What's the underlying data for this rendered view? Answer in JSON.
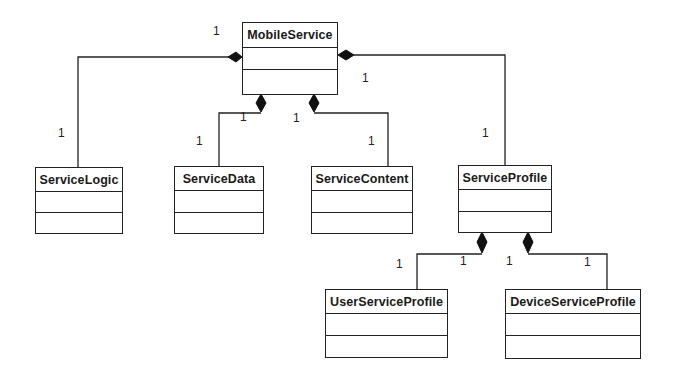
{
  "diagram": {
    "type": "UML class diagram",
    "classes": [
      {
        "id": "mobile_service",
        "name": "MobileService"
      },
      {
        "id": "service_logic",
        "name": "ServiceLogic"
      },
      {
        "id": "service_data",
        "name": "ServiceData"
      },
      {
        "id": "service_content",
        "name": "ServiceContent"
      },
      {
        "id": "service_profile",
        "name": "ServiceProfile"
      },
      {
        "id": "user_service_profile",
        "name": "UserServiceProfile"
      },
      {
        "id": "device_service_profile",
        "name": "DeviceServiceProfile"
      }
    ],
    "relationships": [
      {
        "type": "composition",
        "whole": "MobileService",
        "part": "ServiceLogic",
        "whole_multiplicity": "1",
        "part_multiplicity": "1"
      },
      {
        "type": "composition",
        "whole": "MobileService",
        "part": "ServiceData",
        "whole_multiplicity": "1",
        "part_multiplicity": "1"
      },
      {
        "type": "composition",
        "whole": "MobileService",
        "part": "ServiceContent",
        "whole_multiplicity": "1",
        "part_multiplicity": "1"
      },
      {
        "type": "composition",
        "whole": "MobileService",
        "part": "ServiceProfile",
        "whole_multiplicity": "1",
        "part_multiplicity": "1"
      },
      {
        "type": "composition",
        "whole": "ServiceProfile",
        "part": "UserServiceProfile",
        "whole_multiplicity": "1",
        "part_multiplicity": "1"
      },
      {
        "type": "composition",
        "whole": "ServiceProfile",
        "part": "DeviceServiceProfile",
        "whole_multiplicity": "1",
        "part_multiplicity": "1"
      }
    ],
    "multiplicity_labels": [
      {
        "text": "1",
        "x": 213,
        "y": 25
      },
      {
        "text": "1",
        "x": 58,
        "y": 127
      },
      {
        "text": "1",
        "x": 362,
        "y": 72
      },
      {
        "text": "1",
        "x": 240,
        "y": 111
      },
      {
        "text": "1",
        "x": 293,
        "y": 112
      },
      {
        "text": "1",
        "x": 196,
        "y": 135
      },
      {
        "text": "1",
        "x": 368,
        "y": 135
      },
      {
        "text": "1",
        "x": 482,
        "y": 127
      },
      {
        "text": "1",
        "x": 396,
        "y": 258
      },
      {
        "text": "1",
        "x": 460,
        "y": 255
      },
      {
        "text": "1",
        "x": 506,
        "y": 255
      },
      {
        "text": "1",
        "x": 584,
        "y": 256
      }
    ]
  },
  "colors": {
    "line": "#222222",
    "background": "#ffffff"
  }
}
